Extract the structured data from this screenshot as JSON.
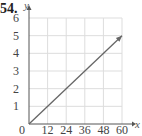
{
  "problem_number": "54.",
  "chart_data": {
    "type": "line",
    "title": "",
    "xlabel": "x",
    "ylabel": "y",
    "x_ticks": [
      "0",
      "12",
      "24",
      "36",
      "48",
      "60"
    ],
    "y_ticks": [
      "1",
      "2",
      "3",
      "4",
      "5",
      "6"
    ],
    "xlim": [
      0,
      60
    ],
    "ylim": [
      0,
      6
    ],
    "grid": true,
    "series": [
      {
        "name": "line",
        "x": [
          0,
          60
        ],
        "y": [
          0,
          5
        ],
        "arrow_at_end": true
      }
    ]
  },
  "colors": {
    "grid": "#dddddd",
    "axis": "#555555",
    "line": "#666666"
  }
}
